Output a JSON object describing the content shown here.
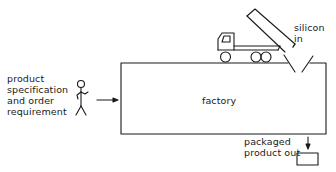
{
  "diagram": {
    "labels": {
      "product_spec": [
        "product",
        "specification",
        "and order",
        "requirement"
      ],
      "factory": "factory",
      "silicon_in": [
        "silicon",
        "in"
      ],
      "packaged_out": [
        "packaged",
        "product out"
      ]
    },
    "elements": {
      "actor": "stick-figure",
      "factory_box": "rectangle",
      "truck": "tipper-truck",
      "hopper": "v-funnel",
      "output_box": "small-rectangle"
    },
    "flows": [
      {
        "from": "customer",
        "to": "factory",
        "label": "product specification and order requirement"
      },
      {
        "from": "truck",
        "to": "factory",
        "label": "silicon in"
      },
      {
        "from": "factory",
        "to": "output_box",
        "label": "packaged product out"
      }
    ],
    "colors": {
      "stroke": "#1a1a1a",
      "background": "#ffffff"
    }
  }
}
